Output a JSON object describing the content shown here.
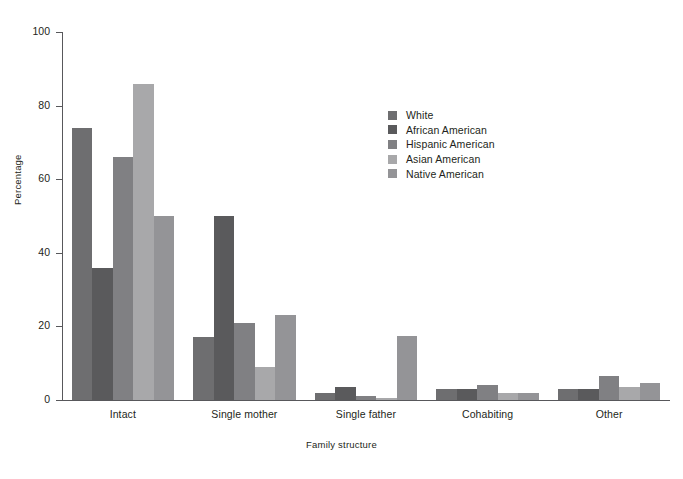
{
  "chart_data": {
    "type": "bar",
    "title": "",
    "subtitle": "",
    "xlabel": "Family structure",
    "ylabel": "Percentage",
    "categories": [
      "Intact",
      "Single mother",
      "Single father",
      "Cohabiting",
      "Other"
    ],
    "series": [
      {
        "name": "White",
        "color": "#6e6e70",
        "values": [
          74,
          17,
          2,
          3,
          3
        ]
      },
      {
        "name": "African American",
        "color": "#5a5a5c",
        "values": [
          36,
          50,
          3.5,
          3,
          3
        ]
      },
      {
        "name": "Hispanic American",
        "color": "#808083",
        "values": [
          66,
          21,
          1,
          4,
          6.5
        ]
      },
      {
        "name": "Asian American",
        "color": "#a8a8aa",
        "values": [
          86,
          9,
          0.5,
          2,
          3.5
        ]
      },
      {
        "name": "Native American",
        "color": "#949497",
        "values": [
          50,
          23,
          17.5,
          2,
          4.5
        ]
      }
    ],
    "ylim": [
      0,
      100
    ],
    "yticks": [
      0,
      20,
      40,
      60,
      80,
      100
    ],
    "ytick_labels": [
      "0",
      "20",
      "40",
      "60",
      "80",
      "100"
    ],
    "grid": false,
    "legend_position": "center-right",
    "axis_color": "#58585b",
    "background": "#ffffff"
  },
  "legend": {
    "entries": [
      "White",
      "African American",
      "Hispanic American",
      "Asian American",
      "Native American"
    ]
  },
  "axes": {
    "y_label": "Percentage",
    "x_label": "Family structure"
  }
}
